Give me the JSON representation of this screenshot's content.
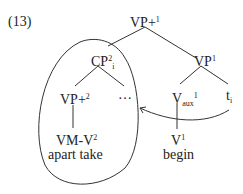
{
  "example_number": "(13)",
  "tree": {
    "root": {
      "base": "VP+",
      "sup": "1"
    },
    "cp": {
      "base": "CP",
      "sup": "2",
      "sub": "i"
    },
    "vp1": {
      "base": "VP",
      "sup": "1"
    },
    "vp2": {
      "base": "VP+",
      "sup": "2"
    },
    "ellipsis": "…",
    "vaux": {
      "base": "V",
      "sub": "aux",
      "sup": "1"
    },
    "trace": {
      "base": "t",
      "sub": "i"
    },
    "vmv2": {
      "base": "VM-V",
      "sup": "2"
    },
    "v1": {
      "base": "V",
      "sup": "1"
    },
    "gloss_left": "apart take",
    "gloss_right": "begin"
  },
  "colors": {
    "lines": "#333333",
    "text": "#222222"
  }
}
